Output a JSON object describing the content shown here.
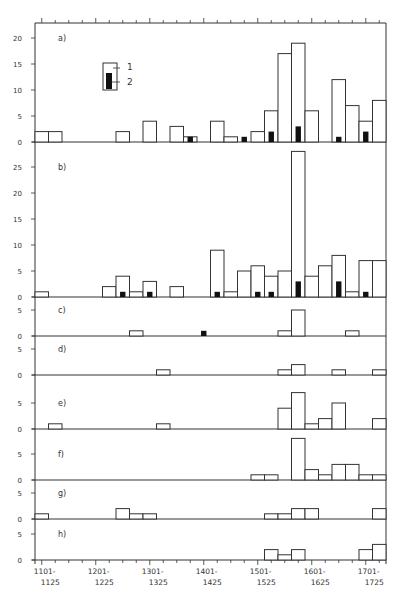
{
  "chart_data": {
    "type": "bar",
    "title": "",
    "xlabel": "",
    "ylabel": "",
    "bin_width_years": 25,
    "bins": [
      "1101-1125",
      "1126-1150",
      "1151-1175",
      "1176-1200",
      "1201-1225",
      "1226-1250",
      "1251-1275",
      "1276-1300",
      "1301-1325",
      "1326-1350",
      "1351-1375",
      "1376-1400",
      "1401-1425",
      "1426-1450",
      "1451-1475",
      "1476-1500",
      "1501-1525",
      "1526-1550",
      "1551-1575",
      "1576-1600",
      "1601-1625",
      "1626-1650",
      "1651-1675",
      "1676-1700",
      "1701-1725",
      "1726-1750"
    ],
    "x_tick_labels": [
      {
        "line1": "1101-",
        "line2": "1125",
        "bin": 0
      },
      {
        "line1": "1201-",
        "line2": "1225",
        "bin": 4
      },
      {
        "line1": "1301-",
        "line2": "1325",
        "bin": 8
      },
      {
        "line1": "1401-",
        "line2": "1425",
        "bin": 12
      },
      {
        "line1": "1501-",
        "line2": "1525",
        "bin": 16
      },
      {
        "line1": "1601-",
        "line2": "1625",
        "bin": 20
      },
      {
        "line1": "1701-",
        "line2": "1725",
        "bin": 24
      }
    ],
    "legend": [
      {
        "key": "1",
        "style": "open bar"
      },
      {
        "key": "2",
        "style": "filled black bar"
      }
    ],
    "panels": [
      {
        "label": "a)",
        "ylim": [
          0,
          22
        ],
        "yticks": [
          0,
          5,
          10,
          15,
          20
        ],
        "series": [
          {
            "name": "1",
            "values": [
              2,
              2,
              0,
              0,
              0,
              0,
              2,
              0,
              4,
              0,
              3,
              1,
              0,
              4,
              1,
              0,
              2,
              6,
              17,
              19,
              6,
              0,
              12,
              7,
              4,
              8
            ]
          },
          {
            "name": "2",
            "values": [
              0,
              0,
              0,
              0,
              0,
              0,
              0,
              0,
              0,
              0,
              0,
              1,
              0,
              0,
              0,
              1,
              0,
              2,
              0,
              3,
              0,
              0,
              1,
              0,
              2,
              0
            ]
          }
        ]
      },
      {
        "label": "b)",
        "ylim": [
          0,
          29
        ],
        "yticks": [
          0,
          5,
          10,
          15,
          20,
          25
        ],
        "series": [
          {
            "name": "1",
            "values": [
              1,
              0,
              0,
              0,
              0,
              2,
              4,
              1,
              3,
              0,
              2,
              0,
              0,
              9,
              1,
              5,
              6,
              4,
              5,
              28,
              4,
              6,
              8,
              1,
              7,
              7
            ]
          },
          {
            "name": "2",
            "values": [
              0,
              0,
              0,
              0,
              0,
              0,
              1,
              0,
              1,
              0,
              0,
              0,
              0,
              1,
              0,
              0,
              1,
              1,
              0,
              3,
              0,
              0,
              3,
              0,
              1,
              0
            ]
          }
        ]
      },
      {
        "label": "c)",
        "ylim": [
          0,
          6
        ],
        "yticks": [
          0,
          5
        ],
        "series": [
          {
            "name": "1",
            "values": [
              0,
              0,
              0,
              0,
              0,
              0,
              0,
              1,
              0,
              0,
              0,
              0,
              0,
              0,
              0,
              0,
              0,
              0,
              1,
              5,
              0,
              0,
              0,
              1,
              0,
              0
            ]
          },
          {
            "name": "2",
            "values": [
              0,
              0,
              0,
              0,
              0,
              0,
              0,
              0,
              0,
              0,
              0,
              0,
              1,
              0,
              0,
              0,
              0,
              0,
              0,
              0,
              0,
              0,
              0,
              0,
              0,
              0
            ]
          }
        ]
      },
      {
        "label": "d)",
        "ylim": [
          0,
          6
        ],
        "yticks": [
          0,
          5
        ],
        "series": [
          {
            "name": "1",
            "values": [
              0,
              0,
              0,
              0,
              0,
              0,
              0,
              0,
              0,
              1,
              0,
              0,
              0,
              0,
              0,
              0,
              0,
              0,
              1,
              2,
              0,
              0,
              1,
              0,
              0,
              1
            ]
          }
        ]
      },
      {
        "label": "e)",
        "ylim": [
          0,
          9
        ],
        "yticks": [
          0,
          5
        ],
        "series": [
          {
            "name": "1",
            "values": [
              0,
              1,
              0,
              0,
              0,
              0,
              0,
              0,
              0,
              1,
              0,
              0,
              0,
              0,
              0,
              0,
              0,
              0,
              4,
              7,
              1,
              2,
              5,
              0,
              0,
              2
            ]
          }
        ]
      },
      {
        "label": "f)",
        "ylim": [
          0,
          10
        ],
        "yticks": [
          0,
          5
        ],
        "series": [
          {
            "name": "1",
            "values": [
              0,
              0,
              0,
              0,
              0,
              0,
              0,
              0,
              0,
              0,
              0,
              0,
              0,
              0,
              0,
              0,
              1,
              1,
              0,
              8,
              2,
              1,
              3,
              3,
              1,
              1
            ]
          }
        ]
      },
      {
        "label": "g)",
        "ylim": [
          0,
          6
        ],
        "yticks": [
          0,
          5
        ],
        "series": [
          {
            "name": "1",
            "values": [
              1,
              0,
              0,
              0,
              0,
              0,
              2,
              1,
              1,
              0,
              0,
              0,
              0,
              0,
              0,
              0,
              0,
              1,
              1,
              2,
              2,
              0,
              0,
              0,
              0,
              2
            ]
          }
        ]
      },
      {
        "label": "h)",
        "ylim": [
          0,
          6
        ],
        "yticks": [
          0,
          5
        ],
        "series": [
          {
            "name": "1",
            "values": [
              0,
              0,
              0,
              0,
              0,
              0,
              0,
              0,
              0,
              0,
              0,
              0,
              0,
              0,
              0,
              0,
              0,
              2,
              1,
              2,
              0,
              0,
              0,
              0,
              2,
              3
            ]
          }
        ]
      }
    ]
  },
  "layout": {
    "plot_left": 35,
    "plot_right": 386,
    "plot_top": 23,
    "px_per_unit": 5.2,
    "panel_baselines": [
      142,
      297,
      336,
      375,
      429,
      480,
      519,
      560
    ],
    "panel_tops": [
      23,
      142,
      297,
      336,
      375,
      429,
      480,
      519
    ],
    "colors": {
      "line": "#333333",
      "fill_open": "#ffffff",
      "fill_black": "#111111"
    }
  }
}
